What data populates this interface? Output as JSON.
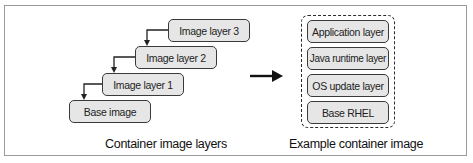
{
  "left_diagram": {
    "caption": "Container image layers",
    "layers": [
      {
        "label": "Image layer 3"
      },
      {
        "label": "Image layer 2"
      },
      {
        "label": "Image layer 1"
      },
      {
        "label": "Base image"
      }
    ]
  },
  "right_diagram": {
    "caption": "Example container image",
    "layers": [
      {
        "label": "Application layer"
      },
      {
        "label": "Java runtime layer"
      },
      {
        "label": "OS update layer"
      },
      {
        "label": "Base RHEL"
      }
    ]
  },
  "colors": {
    "box_fill": "#e6e6e6",
    "box_border": "#3a3a3a",
    "frame_border": "#9a9a9a",
    "arrow": "#111111"
  }
}
